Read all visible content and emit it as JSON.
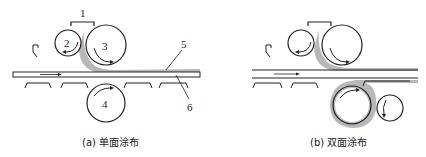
{
  "panels": [
    {
      "id": "a",
      "caption": "(a) 单面涂布",
      "labels": {
        "bracket": "1",
        "roll_small": "2",
        "roll_top": "3",
        "roll_bottom": "4",
        "coating": "5",
        "substrate": "6"
      }
    },
    {
      "id": "b",
      "caption": "(b) 双面涂布"
    }
  ],
  "colors": {
    "stroke": "#222222",
    "coating": "#b8b8b8"
  }
}
